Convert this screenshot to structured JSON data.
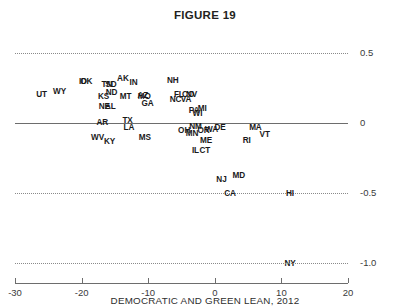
{
  "figure": {
    "title": "FIGURE 19",
    "caption": "DEMOCRATIC AND GREEN LEAN, 2012"
  },
  "chart_data": {
    "type": "scatter",
    "title": "FIGURE 19",
    "xlabel": "DEMOCRATIC AND GREEN LEAN, 2012",
    "ylabel": "",
    "xlim": [
      -30,
      20
    ],
    "ylim": [
      -1.0,
      0.5
    ],
    "xticks": [
      -30,
      -20,
      -10,
      0,
      10,
      20
    ],
    "xticklabels": [
      "-30",
      "-20",
      "-10",
      "0",
      "10",
      "20"
    ],
    "yticks": [
      0.5,
      0,
      -0.5,
      -1.0
    ],
    "yticklabels": [
      "0.5",
      "0",
      "-0.5",
      "-1.0"
    ],
    "grid": "dotted horizontal gridlines at y = 0.5, -0.5, -1.0; solid line at y = 0",
    "legend": "none",
    "point_labels": "two-letter US state abbreviations",
    "points": [
      {
        "label": "UT",
        "x": -26.0,
        "y": 0.21
      },
      {
        "label": "WY",
        "x": -23.3,
        "y": 0.23
      },
      {
        "label": "ID",
        "x": -19.8,
        "y": 0.3
      },
      {
        "label": "OK",
        "x": -19.3,
        "y": 0.3
      },
      {
        "label": "TN",
        "x": -16.2,
        "y": 0.28
      },
      {
        "label": "SD",
        "x": -15.6,
        "y": 0.28
      },
      {
        "label": "AK",
        "x": -13.8,
        "y": 0.32
      },
      {
        "label": "IN",
        "x": -12.2,
        "y": 0.29
      },
      {
        "label": "KS",
        "x": -16.7,
        "y": 0.19
      },
      {
        "label": "ND",
        "x": -15.5,
        "y": 0.22
      },
      {
        "label": "MT",
        "x": -13.4,
        "y": 0.19
      },
      {
        "label": "AZ",
        "x": -10.8,
        "y": 0.2
      },
      {
        "label": "MO",
        "x": -10.6,
        "y": 0.19
      },
      {
        "label": "NE",
        "x": -16.6,
        "y": 0.12
      },
      {
        "label": "AL",
        "x": -15.7,
        "y": 0.12
      },
      {
        "label": "GA",
        "x": -10.1,
        "y": 0.14
      },
      {
        "label": "NH",
        "x": -6.3,
        "y": 0.31
      },
      {
        "label": "FL",
        "x": -5.4,
        "y": 0.21
      },
      {
        "label": "CO",
        "x": -4.0,
        "y": 0.21
      },
      {
        "label": "NV",
        "x": -3.5,
        "y": 0.21
      },
      {
        "label": "NC",
        "x": -5.9,
        "y": 0.17
      },
      {
        "label": "VA",
        "x": -4.3,
        "y": 0.17
      },
      {
        "label": "PA",
        "x": -3.1,
        "y": 0.09
      },
      {
        "label": "WI",
        "x": -2.6,
        "y": 0.07
      },
      {
        "label": "MI",
        "x": -1.9,
        "y": 0.11
      },
      {
        "label": "AR",
        "x": -16.9,
        "y": 0.01
      },
      {
        "label": "TX",
        "x": -13.1,
        "y": 0.02
      },
      {
        "label": "LA",
        "x": -12.9,
        "y": -0.03
      },
      {
        "label": "NM",
        "x": -2.9,
        "y": -0.02
      },
      {
        "label": "OH",
        "x": -4.6,
        "y": -0.05
      },
      {
        "label": "MN",
        "x": -3.4,
        "y": -0.07
      },
      {
        "label": "OR",
        "x": -1.7,
        "y": -0.05
      },
      {
        "label": "WA",
        "x": -0.5,
        "y": -0.04
      },
      {
        "label": "DE",
        "x": 0.8,
        "y": -0.03
      },
      {
        "label": "MA",
        "x": 6.1,
        "y": -0.03
      },
      {
        "label": "VT",
        "x": 7.5,
        "y": -0.08
      },
      {
        "label": "WV",
        "x": -17.6,
        "y": -0.1
      },
      {
        "label": "KY",
        "x": -15.8,
        "y": -0.13
      },
      {
        "label": "MS",
        "x": -10.5,
        "y": -0.1
      },
      {
        "label": "ME",
        "x": -1.3,
        "y": -0.12
      },
      {
        "label": "RI",
        "x": 4.8,
        "y": -0.12
      },
      {
        "label": "IL",
        "x": -2.9,
        "y": -0.19
      },
      {
        "label": "CT",
        "x": -1.5,
        "y": -0.19
      },
      {
        "label": "NJ",
        "x": 1.0,
        "y": -0.4
      },
      {
        "label": "MD",
        "x": 3.6,
        "y": -0.37
      },
      {
        "label": "CA",
        "x": 2.3,
        "y": -0.5
      },
      {
        "label": "HI",
        "x": 11.3,
        "y": -0.5
      },
      {
        "label": "NY",
        "x": 11.3,
        "y": -1.0
      }
    ]
  },
  "axis": {
    "y_labels": [
      {
        "text": "0.5",
        "value": 0.5
      },
      {
        "text": "0",
        "value": 0
      },
      {
        "text": "-0.5",
        "value": -0.5
      },
      {
        "text": "-1.0",
        "value": -1.0
      }
    ],
    "x_labels": [
      {
        "text": "-30",
        "value": -30
      },
      {
        "text": "-20",
        "value": -20
      },
      {
        "text": "-10",
        "value": -10
      },
      {
        "text": "0",
        "value": 0
      },
      {
        "text": "10",
        "value": 10
      },
      {
        "text": "20",
        "value": 20
      }
    ]
  },
  "colors": {
    "background": "#ffffff",
    "text": "#231f20",
    "axis": "#6d6d6d",
    "grid": "#8a8a8a"
  }
}
